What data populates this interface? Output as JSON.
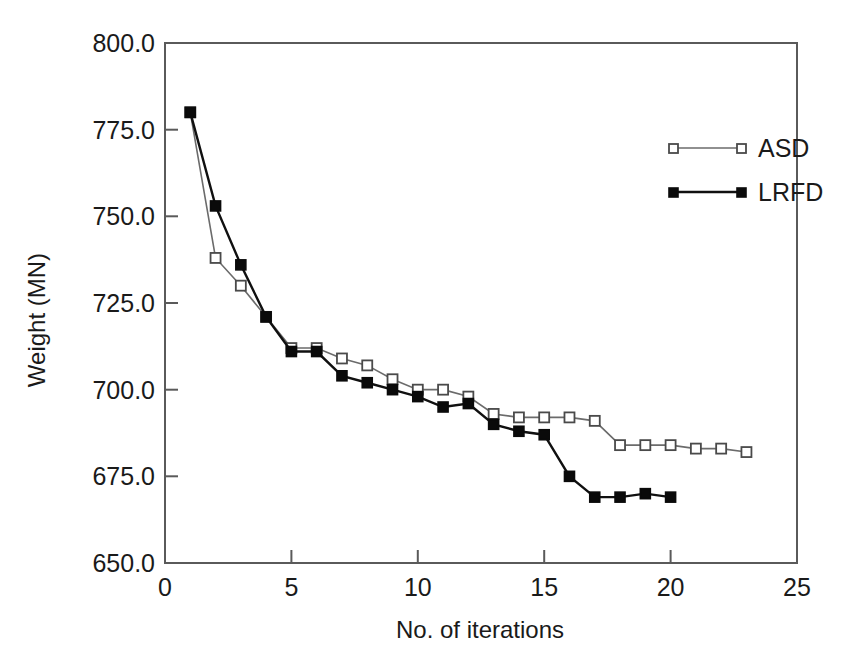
{
  "chart_data": {
    "type": "line",
    "title": "",
    "subtitle": "",
    "xlabel": "No. of iterations",
    "ylabel": "Weight (MN)",
    "xlim": [
      0,
      25
    ],
    "ylim": [
      650.0,
      800.0
    ],
    "xticks": [
      0,
      5,
      10,
      15,
      20,
      25
    ],
    "xtick_labels": [
      "0",
      "5",
      "10",
      "15",
      "20",
      "25"
    ],
    "yticks": [
      650.0,
      675.0,
      700.0,
      725.0,
      750.0,
      775.0,
      800.0
    ],
    "ytick_labels": [
      "650.0",
      "675.0",
      "700.0",
      "725.0",
      "750.0",
      "775.0",
      "800.0"
    ],
    "grid": false,
    "legend_position": "upper-right-inside",
    "series": [
      {
        "name": "ASD",
        "marker": "open-square",
        "color": "#6b6b6b",
        "x": [
          1,
          2,
          3,
          4,
          5,
          6,
          7,
          8,
          9,
          10,
          11,
          12,
          13,
          14,
          15,
          16,
          17,
          18,
          19,
          20,
          21,
          22,
          23
        ],
        "values": [
          780,
          738,
          730,
          721,
          712,
          712,
          709,
          707,
          703,
          700,
          700,
          698,
          693,
          692,
          692,
          692,
          691,
          684,
          684,
          684,
          683,
          683,
          682
        ]
      },
      {
        "name": "LRFD",
        "marker": "filled-square",
        "color": "#0a0a0a",
        "x": [
          1,
          2,
          3,
          4,
          5,
          6,
          7,
          8,
          9,
          10,
          11,
          12,
          13,
          14,
          15,
          16,
          17,
          18,
          19,
          20
        ],
        "values": [
          780,
          753,
          736,
          721,
          711,
          711,
          704,
          702,
          700,
          698,
          695,
          696,
          690,
          688,
          687,
          675,
          669,
          669,
          670,
          669
        ]
      }
    ]
  },
  "legend": {
    "entries": [
      {
        "label": "ASD"
      },
      {
        "label": "LRFD"
      }
    ]
  }
}
